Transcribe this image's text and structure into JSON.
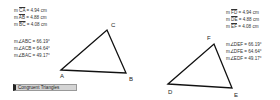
{
  "left": {
    "lengths": [
      {
        "prefix": "m ",
        "segment": "CA",
        "value": " = 4.94 cm"
      },
      {
        "prefix": "m ",
        "segment": "AB",
        "value": " = 4.88 cm"
      },
      {
        "prefix": "m ",
        "segment": "BC",
        "value": " = 4.08 cm"
      }
    ],
    "angles": [
      {
        "text": "m∠ABC = 66.19°"
      },
      {
        "text": "m∠ACB = 64.64°"
      },
      {
        "text": "m∠BAC = 49.17°"
      }
    ],
    "vertices": {
      "A": "A",
      "B": "B",
      "C": "C"
    }
  },
  "right": {
    "lengths": [
      {
        "prefix": "m ",
        "segment": "FD",
        "value": " = 4.94 cm"
      },
      {
        "prefix": "m ",
        "segment": "DE",
        "value": " = 4.88 cm"
      },
      {
        "prefix": "m ",
        "segment": "EF",
        "value": " = 4.08 cm"
      }
    ],
    "angles": [
      {
        "text": "m∠DEF = 66.19°"
      },
      {
        "text": "m∠DFE = 64.64°"
      },
      {
        "text": "m∠EDF = 49.17°"
      }
    ],
    "vertices": {
      "D": "D",
      "E": "E",
      "F": "F"
    }
  },
  "button": {
    "label": "Congruent Triangles"
  }
}
